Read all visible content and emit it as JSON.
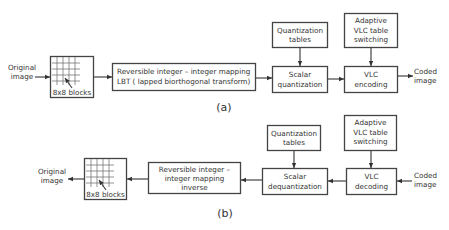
{
  "diagram_title": "",
  "encoder": {
    "caption": "(a)",
    "input_label": [
      "Original",
      "image"
    ],
    "blocks_label": "8x8 blocks",
    "transform_label": [
      "Reversible integer – integer mapping",
      "LBT ( lapped biorthogonal transform)"
    ],
    "quant_tables_label": [
      "Quantization",
      "tables"
    ],
    "scalar_quant_label": [
      "Scalar",
      "quantization"
    ],
    "adaptive_vlc_label": [
      "Adaptive",
      "VLC table",
      "switching"
    ],
    "vlc_label": [
      "VLC",
      "encoding"
    ],
    "output_label": [
      "Coded",
      "image"
    ]
  },
  "decoder": {
    "caption": "(b)",
    "output_label": [
      "Original",
      "image"
    ],
    "blocks_label": "8x8 blocks",
    "transform_label": [
      "Reversible integer –",
      "integer mapping",
      "inverse"
    ],
    "quant_tables_label": [
      "Quantization",
      "tables"
    ],
    "scalar_dequant_label": [
      "Scalar",
      "dequantization"
    ],
    "adaptive_vlc_label": [
      "Adaptive",
      "VLC table",
      "switching"
    ],
    "vlc_label": [
      "VLC",
      "decoding"
    ],
    "input_label": [
      "Coded",
      "image"
    ]
  }
}
